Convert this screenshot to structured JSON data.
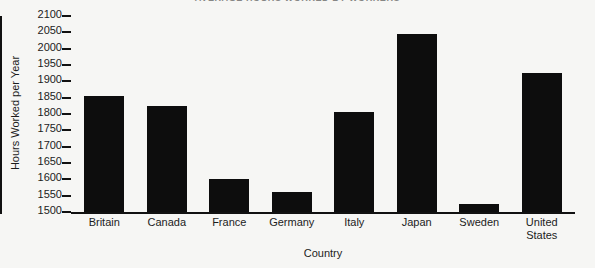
{
  "chart_data": {
    "type": "bar",
    "title": "AVERAGE HOURS WORKED BY WORKERS",
    "xlabel": "Country",
    "ylabel": "Hours Worked per Year",
    "categories": [
      "Britain",
      "Canada",
      "France",
      "Germany",
      "Italy",
      "Japan",
      "Sweden",
      "United States"
    ],
    "values": [
      1855,
      1825,
      1600,
      1560,
      1805,
      2045,
      1525,
      1925
    ],
    "ylim": [
      1500,
      2100
    ],
    "ytick_step": 50,
    "yticks": [
      2100,
      2050,
      2000,
      1950,
      1900,
      1850,
      1800,
      1750,
      1700,
      1650,
      1600,
      1550,
      1500
    ],
    "ytick_labels": [
      "2100",
      "2050",
      "2000",
      "1950",
      "1900",
      "1850",
      "1800",
      "1750",
      "1700",
      "1650",
      "1600",
      "1550",
      "1500"
    ],
    "grid": false,
    "legend": false,
    "legend_position": "none",
    "bar_color": "#0d0d0d",
    "background_color": "#f6f6f4",
    "axis_color": "#111111"
  },
  "xtick_labels_wrapped": [
    [
      "Britain"
    ],
    [
      "Canada"
    ],
    [
      "France"
    ],
    [
      "Germany"
    ],
    [
      "Italy"
    ],
    [
      "Japan"
    ],
    [
      "Sweden"
    ],
    [
      "United",
      "States"
    ]
  ]
}
